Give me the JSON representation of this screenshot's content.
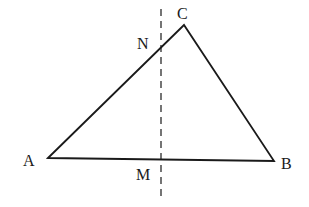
{
  "diagram": {
    "type": "geometry",
    "points": {
      "A": {
        "label": "A",
        "x": 48,
        "y": 158
      },
      "B": {
        "label": "B",
        "x": 274,
        "y": 161
      },
      "C": {
        "label": "C",
        "x": 184,
        "y": 25
      },
      "N": {
        "label": "N",
        "x": 161,
        "y": 47
      },
      "M": {
        "label": "M",
        "x": 161,
        "y": 160
      }
    },
    "segments": [
      "AB",
      "BC",
      "CA"
    ],
    "dashed_line": {
      "x": 161,
      "y1": 9,
      "y2": 196
    },
    "colors": {
      "stroke": "#1a1a1a",
      "background": "#ffffff"
    }
  }
}
